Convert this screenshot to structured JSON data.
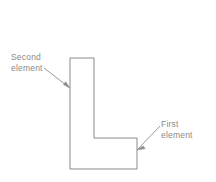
{
  "canvas": {
    "width": 216,
    "height": 182,
    "background_color": "#ffffff"
  },
  "style": {
    "stroke_color": "#8a8a8a",
    "leader_color": "#9a9a9a",
    "text_color": "#8a8a8a",
    "shape_fill": "#ffffff",
    "stroke_width": 1
  },
  "shape": {
    "name": "l-shaped-profile",
    "points": "70,58 94,58 94,138 137,138 137,169 70,169"
  },
  "callouts": [
    {
      "id": "second-element",
      "line1": "Second",
      "line2": "element",
      "leader": {
        "x1": 44,
        "y1": 68,
        "x2": 70,
        "y2": 88
      },
      "arrow_tip": {
        "x": 70,
        "y": 88
      }
    },
    {
      "id": "first-element",
      "line1": "First",
      "line2": "element",
      "leader": {
        "x1": 160,
        "y1": 126,
        "x2": 137,
        "y2": 150
      },
      "arrow_tip": {
        "x": 137,
        "y": 150
      }
    }
  ]
}
